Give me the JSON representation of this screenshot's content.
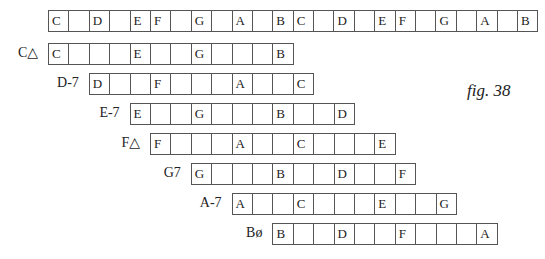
{
  "chromatic_scale": [
    "C",
    "",
    "D",
    "",
    "E",
    "F",
    "",
    "G",
    "",
    "A",
    "",
    "B",
    "C",
    "",
    "D",
    "",
    "E",
    "F",
    "",
    "G",
    "",
    "A",
    "",
    "B"
  ],
  "chords": [
    {
      "label": "C△",
      "start": 0,
      "cells": [
        "C",
        "",
        "",
        "",
        "E",
        "",
        "",
        "G",
        "",
        "",
        "",
        "B"
      ]
    },
    {
      "label": "D-7",
      "start": 2,
      "cells": [
        "D",
        "",
        "",
        "F",
        "",
        "",
        "",
        "A",
        "",
        "",
        "C"
      ]
    },
    {
      "label": "E-7",
      "start": 4,
      "cells": [
        "E",
        "",
        "",
        "G",
        "",
        "",
        "",
        "B",
        "",
        "",
        "D"
      ]
    },
    {
      "label": "F△",
      "start": 5,
      "cells": [
        "F",
        "",
        "",
        "",
        "A",
        "",
        "",
        "C",
        "",
        "",
        "",
        "E"
      ]
    },
    {
      "label": "G7",
      "start": 7,
      "cells": [
        "G",
        "",
        "",
        "",
        "B",
        "",
        "",
        "D",
        "",
        "",
        "F"
      ]
    },
    {
      "label": "A-7",
      "start": 9,
      "cells": [
        "A",
        "",
        "",
        "C",
        "",
        "",
        "",
        "E",
        "",
        "",
        "G"
      ]
    },
    {
      "label": "Bø",
      "start": 11,
      "cells": [
        "B",
        "",
        "",
        "D",
        "",
        "",
        "F",
        "",
        "",
        "",
        "A"
      ]
    }
  ],
  "figure_label": "fig. 38"
}
